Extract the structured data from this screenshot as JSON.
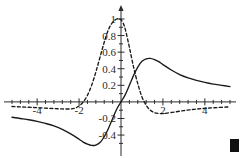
{
  "chart_data": {
    "type": "line",
    "title": "",
    "xlabel": "",
    "ylabel": "",
    "xlim": [
      -5.2,
      5.2
    ],
    "ylim": [
      -0.58,
      1.06
    ],
    "grid": false,
    "legend_position": "none",
    "axis_style": "cross",
    "x_ticks": [
      -4,
      -2,
      2,
      4
    ],
    "x_tick_labels": [
      "-4",
      "-2",
      "2",
      "4"
    ],
    "y_ticks": [
      1,
      0.8,
      0.6,
      0.4,
      0.2,
      -0.2,
      -0.4
    ],
    "y_tick_labels": [
      "1",
      "0.8",
      "0.6",
      "0.4",
      "0.2",
      "-0.2",
      "-0.4"
    ],
    "x_minor_tick_step": 0.4,
    "y_minor_tick_step": 0.1,
    "series": [
      {
        "name": "solid-curve",
        "style": "solid",
        "color": "#1a1a1a",
        "x": [
          -5.2,
          -4.8,
          -4.4,
          -4.0,
          -3.6,
          -3.2,
          -2.8,
          -2.4,
          -2.0,
          -1.8,
          -1.6,
          -1.4,
          -1.2,
          -1.0,
          -0.8,
          -0.6,
          -0.4,
          -0.2,
          0.0,
          0.2,
          0.4,
          0.6,
          0.8,
          1.0,
          1.2,
          1.4,
          1.6,
          1.8,
          2.0,
          2.4,
          2.8,
          3.2,
          3.6,
          4.0,
          4.4,
          4.8,
          5.2
        ],
        "y": [
          -0.185,
          -0.2,
          -0.215,
          -0.235,
          -0.26,
          -0.29,
          -0.33,
          -0.385,
          -0.45,
          -0.485,
          -0.51,
          -0.525,
          -0.52,
          -0.49,
          -0.42,
          -0.32,
          -0.2,
          -0.085,
          0.0,
          0.085,
          0.2,
          0.32,
          0.42,
          0.49,
          0.52,
          0.525,
          0.51,
          0.485,
          0.45,
          0.385,
          0.33,
          0.29,
          0.26,
          0.235,
          0.215,
          0.2,
          0.185
        ]
      },
      {
        "name": "dashed-curve",
        "style": "dashed",
        "color": "#1a1a1a",
        "x": [
          -5.2,
          -4.8,
          -4.4,
          -4.0,
          -3.6,
          -3.2,
          -2.8,
          -2.4,
          -2.2,
          -2.0,
          -1.8,
          -1.6,
          -1.4,
          -1.2,
          -1.0,
          -0.8,
          -0.6,
          -0.4,
          -0.2,
          -0.1,
          0.0,
          0.1,
          0.2,
          0.4,
          0.6,
          0.8,
          1.0,
          1.2,
          1.4,
          1.6,
          1.8,
          2.0,
          2.2,
          2.6,
          3.0,
          3.4,
          3.8,
          4.2,
          4.6,
          5.0,
          5.2
        ],
        "y": [
          -0.055,
          -0.06,
          -0.065,
          -0.07,
          -0.075,
          -0.08,
          -0.085,
          -0.085,
          -0.075,
          -0.05,
          0.0,
          0.08,
          0.2,
          0.36,
          0.54,
          0.72,
          0.87,
          0.96,
          1.0,
          1.0,
          0.99,
          0.95,
          0.88,
          0.66,
          0.42,
          0.22,
          0.06,
          -0.04,
          -0.1,
          -0.13,
          -0.14,
          -0.14,
          -0.135,
          -0.12,
          -0.105,
          -0.092,
          -0.082,
          -0.074,
          -0.068,
          -0.062,
          -0.06
        ]
      }
    ],
    "annotations": []
  },
  "decorations": {
    "corner_marker": "black-square-marker"
  }
}
